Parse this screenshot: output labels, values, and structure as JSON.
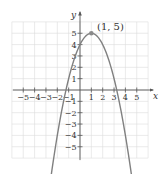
{
  "chart_data": {
    "type": "line",
    "title": "",
    "xlabel": "x",
    "ylabel": "y",
    "xlim": [
      -6,
      6
    ],
    "ylim": [
      -6,
      6
    ],
    "grid": true,
    "x_ticks": [
      -5,
      -4,
      -3,
      -2,
      -1,
      1,
      2,
      3,
      4,
      5
    ],
    "y_ticks": [
      5,
      4,
      3,
      2,
      1,
      -1,
      -2,
      -3,
      -4,
      -5
    ],
    "x_tick_labels": [
      "−5",
      "−4",
      "−3",
      "−2",
      "−1",
      "1",
      "2",
      "3",
      "4",
      "5"
    ],
    "y_tick_labels": [
      "5",
      "4",
      "3",
      "2",
      "1",
      "−1",
      "−2",
      "−3",
      "−4",
      "−5"
    ],
    "series": [
      {
        "name": "parabola",
        "equation": "y = -(x - 1)^2 + 5",
        "a": -1,
        "h": 1,
        "k": 5,
        "x_range": [
          -2.65,
          4.65
        ],
        "arrows_at_ends": true,
        "color": "#808080"
      }
    ],
    "annotations": [
      {
        "text": "(1, 5)",
        "x": 1,
        "y": 5,
        "marker": "dot"
      }
    ]
  },
  "labels": {
    "x_axis": "x",
    "y_axis": "y",
    "vertex": "(1, 5)"
  },
  "colors": {
    "grid": "#dcdcdc",
    "axis": "#555555",
    "curve": "#8a8a8a",
    "text": "#333333"
  }
}
